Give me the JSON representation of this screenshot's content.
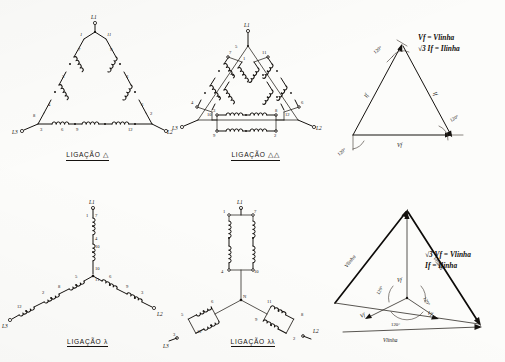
{
  "page": {
    "background": "#fcfcfa",
    "ink": "#15120f"
  },
  "panels": [
    {
      "id": "delta",
      "kind": "schematic",
      "caption": "LIGAÇÃO",
      "caption_symbol": "△",
      "line_terminals": [
        "L1",
        "L2",
        "L3"
      ],
      "coil_numbers": [
        "1",
        "11",
        "7",
        "5",
        "4",
        "8",
        "9",
        "3",
        "6",
        "9",
        "12",
        "2"
      ],
      "winding_count": 6,
      "description": "Delta (triângulo) simples — seis bobinas em série formando três lados"
    },
    {
      "id": "double-delta",
      "kind": "schematic",
      "caption": "LIGAÇÃO",
      "caption_symbol": "△△",
      "line_terminals": [
        "L1",
        "L2",
        "L3"
      ],
      "coil_numbers": [
        "1",
        "7",
        "11",
        "5",
        "4",
        "10",
        "6",
        "12",
        "3",
        "9",
        "8",
        "2"
      ],
      "winding_count": 6,
      "description": "Duplo triângulo — pares de bobinas em paralelo em cada lado"
    },
    {
      "id": "phasor-delta",
      "kind": "phasor",
      "angles": [
        "120°",
        "120°",
        "120°"
      ],
      "edge_labels": [
        "If",
        "If",
        "Vf"
      ],
      "formulas": [
        "Vf = Vlinha",
        "√3 If = Ilinha"
      ],
      "description": "Diagrama fasorial do triângulo"
    },
    {
      "id": "star",
      "kind": "schematic",
      "caption": "LIGAÇÃO",
      "caption_symbol": "λ",
      "line_terminals": [
        "L1",
        "L2",
        "L3"
      ],
      "coil_numbers": [
        "1",
        "7",
        "4",
        "10",
        "11",
        "5",
        "8",
        "2",
        "12",
        "6",
        "9",
        "3"
      ],
      "winding_count": 6,
      "description": "Estrela (Y) simples — três ramos com duas bobinas em série"
    },
    {
      "id": "double-star",
      "kind": "schematic",
      "caption": "LIGAÇÃO",
      "caption_symbol": "λλ",
      "line_terminals": [
        "L1",
        "L2",
        "L3"
      ],
      "coil_numbers": [
        "1",
        "7",
        "4",
        "10",
        "6",
        "12",
        "5",
        "11",
        "3",
        "9",
        "8",
        "2"
      ],
      "winding_count": 6,
      "description": "Dupla estrela — duas bobinas em paralelo por ramo"
    },
    {
      "id": "phasor-star",
      "kind": "phasor",
      "angles": [
        "120°",
        "120°",
        "120°"
      ],
      "edge_labels": [
        "Vlinha",
        "Vlinha",
        "Vlinha"
      ],
      "phase_labels": [
        "Vf",
        "Vf",
        "Vf"
      ],
      "formulas": [
        "√3 Vf = Vlinha",
        "If = Ilinha"
      ],
      "description": "Diagrama fasorial da estrela"
    }
  ]
}
